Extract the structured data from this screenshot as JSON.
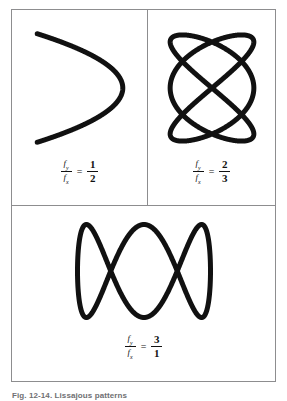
{
  "figure": {
    "caption": "Fig. 12-14. Lissajous patterns",
    "background_color": "#ffffff",
    "frame_color": "#8d8d8f",
    "curve_color": "#111111",
    "equals_sign": "=",
    "panels": [
      {
        "id": "panel-a",
        "label": "Lissajous pattern 1:2",
        "numerator_symbol": "f",
        "numerator_subscript": "y",
        "denominator_symbol": "f",
        "denominator_subscript": "x",
        "ratio_numerator": "1",
        "ratio_denominator": "2"
      },
      {
        "id": "panel-b",
        "label": "Lissajous pattern 2:3",
        "numerator_symbol": "f",
        "numerator_subscript": "y",
        "denominator_symbol": "f",
        "denominator_subscript": "x",
        "ratio_numerator": "2",
        "ratio_denominator": "3"
      },
      {
        "id": "panel-c",
        "label": "Lissajous pattern 3:1",
        "numerator_symbol": "f",
        "numerator_subscript": "y",
        "denominator_symbol": "f",
        "denominator_subscript": "x",
        "ratio_numerator": "3",
        "ratio_denominator": "1"
      }
    ]
  },
  "chart_data": {
    "type": "line",
    "title": "Lissajous patterns",
    "xlabel": "",
    "ylabel": "",
    "grid": false,
    "legend": "none",
    "series": [
      {
        "name": "fy/fx = 1/2",
        "panel": "panel-a",
        "parametric": "x = A*sin(a*t + d), y = B*sin(b*t)",
        "a": 2,
        "b": 1,
        "delta_deg": 90,
        "amplitude_x": 40,
        "amplitude_y": 51,
        "center_px": [
          83,
          84
        ],
        "bbox_px": [
          43,
          33,
          123,
          135
        ],
        "stroke_width_px": 2.2
      },
      {
        "name": "fy/fx = 2/3",
        "panel": "panel-b",
        "parametric": "x = A*sin(a*t + d), y = B*sin(b*t)",
        "a": 3,
        "b": 2,
        "delta_deg": 90,
        "amplitude_x": 39,
        "amplitude_y": 51,
        "center_px": [
          210,
          84
        ],
        "bbox_px": [
          171,
          33,
          249,
          135
        ],
        "stroke_width_px": 2.2
      },
      {
        "name": "fy/fx = 3/1",
        "panel": "panel-c",
        "parametric": "x = A*sin(a*t + d), y = B*sin(b*t)",
        "a": 1,
        "b": 3,
        "delta_deg": 90,
        "amplitude_x": 68,
        "amplitude_y": 48,
        "center_px": [
          143,
          272
        ],
        "bbox_px": [
          75,
          224,
          211,
          320
        ],
        "stroke_width_px": 2.2
      }
    ]
  }
}
